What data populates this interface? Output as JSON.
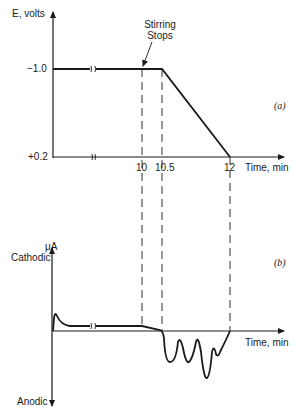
{
  "panel_a": {
    "label": "(a)",
    "y_axis_label": "E, volts",
    "y_ticks": [
      "−1.0",
      "+0.2"
    ],
    "x_ticks": [
      "10",
      "10.5",
      "12"
    ],
    "x_axis_label": "Time, min",
    "annotation": {
      "line1": "Stirring",
      "line2": "Stops"
    }
  },
  "panel_b": {
    "label": "(b)",
    "y_axis_unit": "μA",
    "y_top_label": "Cathodic",
    "y_bottom_label": "Anodic",
    "x_axis_label": "Time, min"
  },
  "colors": {
    "ink": "#1a1a1a",
    "background": "#ffffff"
  }
}
